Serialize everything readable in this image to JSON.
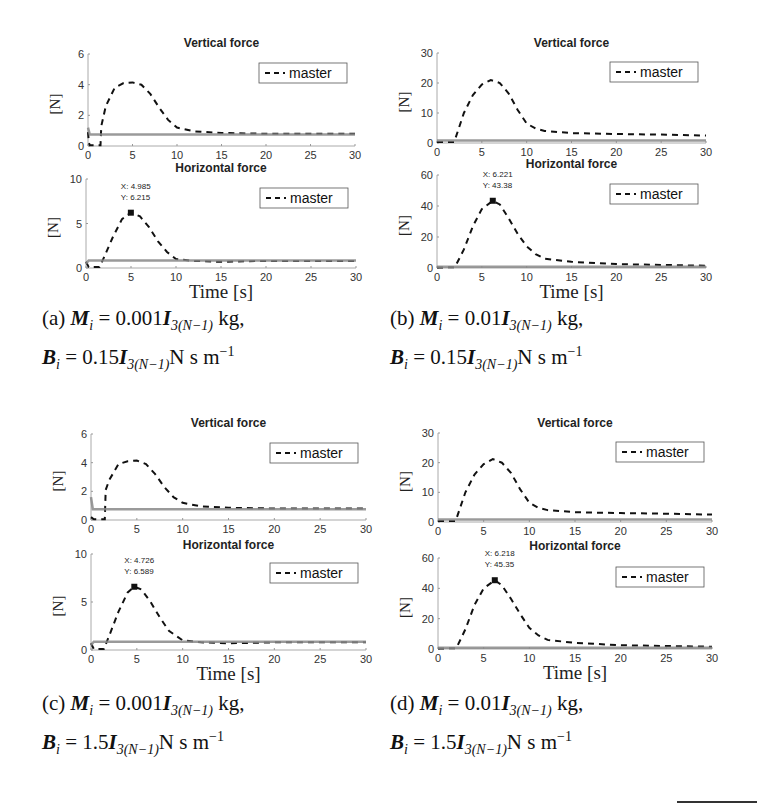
{
  "figure": {
    "panels": [
      {
        "id": "a",
        "caption": {
          "label": "(a)",
          "line1_prefix": "M",
          "line1_sub": "i",
          "line1_eq": " = 0.001",
          "line1_I": "I",
          "line1_I_sub": "3(N−1)",
          "line1_unit": " kg,",
          "line2_prefix": "B",
          "line2_sub": "i",
          "line2_eq": " = 0.15",
          "line2_I": "I",
          "line2_I_sub": "3(N−1)",
          "line2_unit": "N s m",
          "line2_exp": "−1"
        }
      },
      {
        "id": "b",
        "caption": {
          "label": "(b)",
          "line1_prefix": "M",
          "line1_sub": "i",
          "line1_eq": " = 0.01",
          "line1_I": "I",
          "line1_I_sub": "3(N−1)",
          "line1_unit": " kg,",
          "line2_prefix": "B",
          "line2_sub": "i",
          "line2_eq": " = 0.15",
          "line2_I": "I",
          "line2_I_sub": "3(N−1)",
          "line2_unit": "N s m",
          "line2_exp": "−1"
        }
      },
      {
        "id": "c",
        "caption": {
          "label": "(c)",
          "line1_prefix": "M",
          "line1_sub": "i",
          "line1_eq": " = 0.001",
          "line1_I": "I",
          "line1_I_sub": "3(N−1)",
          "line1_unit": " kg,",
          "line2_prefix": "B",
          "line2_sub": "i",
          "line2_eq": " = 1.5",
          "line2_I": "I",
          "line2_I_sub": "3(N−1)",
          "line2_unit": "N s m",
          "line2_exp": "−1"
        }
      },
      {
        "id": "d",
        "caption": {
          "label": "(d)",
          "line1_prefix": "M",
          "line1_sub": "i",
          "line1_eq": " = 0.01",
          "line1_I": "I",
          "line1_I_sub": "3(N−1)",
          "line1_unit": " kg,",
          "line2_prefix": "B",
          "line2_sub": "i",
          "line2_eq": " = 1.5",
          "line2_I": "I",
          "line2_I_sub": "3(N−1)",
          "line2_unit": "N s m",
          "line2_exp": "−1"
        }
      }
    ]
  },
  "chart_data": [
    {
      "panel": "a",
      "subplot": "top",
      "type": "line",
      "title": "Vertical force",
      "xlabel": "",
      "ylabel": "[N]",
      "xlim": [
        0,
        30
      ],
      "ylim": [
        0,
        6
      ],
      "xticks": [
        0,
        5,
        10,
        15,
        20,
        25,
        30
      ],
      "yticks": [
        0,
        2,
        4,
        6
      ],
      "legend": [
        "master"
      ],
      "legend_position": "upper right",
      "series": [
        {
          "name": "master",
          "style": "dashed black",
          "x": [
            0,
            0.1,
            0.2,
            1.4,
            1.5,
            2,
            3,
            4,
            5,
            6,
            7,
            8,
            9,
            10,
            12,
            15,
            20,
            25,
            30
          ],
          "y": [
            0.9,
            0.2,
            0.05,
            0.05,
            1.3,
            2.6,
            3.8,
            4.1,
            4.15,
            4.0,
            3.4,
            2.5,
            1.7,
            1.2,
            0.95,
            0.85,
            0.8,
            0.8,
            0.8
          ]
        },
        {
          "name": "slave (gray solid)",
          "style": "solid gray",
          "x": [
            0,
            0.2,
            30
          ],
          "y": [
            1.2,
            0.75,
            0.75
          ]
        }
      ]
    },
    {
      "panel": "a",
      "subplot": "bottom",
      "type": "line",
      "title": "Horizontal force",
      "xlabel": "Time [s]",
      "ylabel": "[N]",
      "xlim": [
        0,
        30
      ],
      "ylim": [
        0,
        10
      ],
      "xticks": [
        0,
        5,
        10,
        15,
        20,
        25,
        30
      ],
      "yticks": [
        0,
        5,
        10
      ],
      "legend": [
        "master"
      ],
      "legend_position": "upper right",
      "annotation": {
        "x_label": "X: 4.985",
        "y_label": "Y: 6.215",
        "x": 4.985,
        "y": 6.215
      },
      "series": [
        {
          "name": "master",
          "style": "dashed black",
          "x": [
            0,
            0.3,
            1.5,
            2,
            3,
            4,
            4.985,
            6,
            7,
            8,
            9,
            10,
            12,
            15,
            20,
            25,
            30
          ],
          "y": [
            0.7,
            0.1,
            0.1,
            1.2,
            3.5,
            5.5,
            6.215,
            5.8,
            4.6,
            3.0,
            1.8,
            1.0,
            0.8,
            0.7,
            0.8,
            0.8,
            0.8
          ]
        },
        {
          "name": "slave (gray solid)",
          "style": "solid gray",
          "x": [
            0,
            0.3,
            30
          ],
          "y": [
            0.5,
            0.85,
            0.85
          ]
        }
      ]
    },
    {
      "panel": "b",
      "subplot": "top",
      "type": "line",
      "title": "Vertical force",
      "xlabel": "",
      "ylabel": "[N]",
      "xlim": [
        0,
        30
      ],
      "ylim": [
        0,
        30
      ],
      "xticks": [
        0,
        5,
        10,
        15,
        20,
        25,
        30
      ],
      "yticks": [
        0,
        10,
        20,
        30
      ],
      "legend": [
        "master"
      ],
      "legend_position": "upper right",
      "series": [
        {
          "name": "master",
          "style": "dashed black",
          "x": [
            0,
            1.9,
            2,
            3,
            4,
            5,
            6,
            7,
            8,
            9,
            10,
            11,
            12,
            15,
            20,
            25,
            30
          ],
          "y": [
            0.3,
            0.3,
            1.0,
            10,
            16,
            19.5,
            21,
            20,
            16.5,
            11,
            6.5,
            4.8,
            4.0,
            3.3,
            3.0,
            2.8,
            2.5
          ]
        },
        {
          "name": "slave (gray solid)",
          "style": "solid gray",
          "x": [
            0,
            30
          ],
          "y": [
            0.8,
            0.8
          ]
        }
      ]
    },
    {
      "panel": "b",
      "subplot": "bottom",
      "type": "line",
      "title": "Horizontal force",
      "xlabel": "Time [s]",
      "ylabel": "[N]",
      "xlim": [
        0,
        30
      ],
      "ylim": [
        0,
        60
      ],
      "xticks": [
        0,
        5,
        10,
        15,
        20,
        25,
        30
      ],
      "yticks": [
        0,
        20,
        40,
        60
      ],
      "legend": [
        "master"
      ],
      "legend_position": "upper right",
      "annotation": {
        "x_label": "X: 6.221",
        "y_label": "Y: 43.38",
        "x": 6.221,
        "y": 43.38
      },
      "series": [
        {
          "name": "master",
          "style": "dashed black",
          "x": [
            0,
            2,
            3,
            4,
            5,
            6.221,
            7,
            8,
            9,
            10,
            11,
            12,
            15,
            20,
            25,
            30
          ],
          "y": [
            0.3,
            0.5,
            12,
            27,
            38,
            43.38,
            41,
            32,
            22,
            14,
            9,
            6,
            4,
            2.5,
            2,
            1.5
          ]
        },
        {
          "name": "slave (gray solid)",
          "style": "solid gray",
          "x": [
            0,
            30
          ],
          "y": [
            0.8,
            0.8
          ]
        }
      ]
    },
    {
      "panel": "c",
      "subplot": "top",
      "type": "line",
      "title": "Vertical force",
      "xlabel": "",
      "ylabel": "[N]",
      "xlim": [
        0,
        30
      ],
      "ylim": [
        0,
        6
      ],
      "xticks": [
        0,
        5,
        10,
        15,
        20,
        25,
        30
      ],
      "yticks": [
        0,
        2,
        4,
        6
      ],
      "legend": [
        "master"
      ],
      "legend_position": "upper right",
      "series": [
        {
          "name": "master",
          "style": "dashed black",
          "x": [
            0,
            0.3,
            1.5,
            1.6,
            2,
            3,
            4,
            5,
            6,
            7,
            8,
            9,
            10,
            12,
            15,
            20,
            25,
            30
          ],
          "y": [
            0.2,
            0.05,
            0.05,
            2.1,
            2.8,
            3.9,
            4.1,
            4.15,
            3.9,
            3.2,
            2.3,
            1.6,
            1.2,
            0.95,
            0.85,
            0.8,
            0.8,
            0.8
          ]
        },
        {
          "name": "slave (gray solid)",
          "style": "solid gray",
          "x": [
            0,
            0.2,
            30
          ],
          "y": [
            1.6,
            0.75,
            0.75
          ]
        }
      ]
    },
    {
      "panel": "c",
      "subplot": "bottom",
      "type": "line",
      "title": "Horizontal force",
      "xlabel": "Time [s]",
      "ylabel": "[N]",
      "xlim": [
        0,
        30
      ],
      "ylim": [
        0,
        10
      ],
      "xticks": [
        0,
        5,
        10,
        15,
        20,
        25,
        30
      ],
      "yticks": [
        0,
        5,
        10
      ],
      "legend": [
        "master"
      ],
      "legend_position": "upper right",
      "annotation": {
        "x_label": "X: 4.726",
        "y_label": "Y: 6.589",
        "x": 4.726,
        "y": 6.589
      },
      "series": [
        {
          "name": "master",
          "style": "dashed black",
          "x": [
            0,
            0.3,
            1.4,
            2,
            3,
            4,
            4.726,
            5.5,
            6.5,
            7.5,
            8.5,
            10,
            12,
            15,
            20,
            25,
            30
          ],
          "y": [
            0.7,
            0.1,
            0.1,
            1.5,
            4.0,
            6.0,
            6.589,
            6.3,
            5.0,
            3.4,
            2.0,
            1.0,
            0.8,
            0.7,
            0.8,
            0.8,
            0.8
          ]
        },
        {
          "name": "slave (gray solid)",
          "style": "solid gray",
          "x": [
            0,
            0.3,
            30
          ],
          "y": [
            0.5,
            0.85,
            0.85
          ]
        }
      ]
    },
    {
      "panel": "d",
      "subplot": "top",
      "type": "line",
      "title": "Vertical force",
      "xlabel": "",
      "ylabel": "[N]",
      "xlim": [
        0,
        30
      ],
      "ylim": [
        0,
        30
      ],
      "xticks": [
        0,
        5,
        10,
        15,
        20,
        25,
        30
      ],
      "yticks": [
        0,
        10,
        20,
        30
      ],
      "legend": [
        "master"
      ],
      "legend_position": "upper right",
      "series": [
        {
          "name": "master",
          "style": "dashed black",
          "x": [
            0,
            1.9,
            2,
            3,
            4,
            5,
            6,
            7,
            8,
            9,
            10,
            11,
            12,
            15,
            20,
            25,
            30
          ],
          "y": [
            0.3,
            0.3,
            1.0,
            10,
            16,
            19.5,
            21.2,
            20,
            16.5,
            11,
            6.5,
            4.8,
            4.0,
            3.3,
            3.0,
            2.8,
            2.5
          ]
        },
        {
          "name": "slave (gray solid)",
          "style": "solid gray",
          "x": [
            0,
            30
          ],
          "y": [
            0.8,
            0.8
          ]
        }
      ]
    },
    {
      "panel": "d",
      "subplot": "bottom",
      "type": "line",
      "title": "Horizontal force",
      "xlabel": "Time [s]",
      "ylabel": "[N]",
      "xlim": [
        0,
        30
      ],
      "ylim": [
        0,
        60
      ],
      "xticks": [
        0,
        5,
        10,
        15,
        20,
        25,
        30
      ],
      "yticks": [
        0,
        20,
        40,
        60
      ],
      "legend": [
        "master"
      ],
      "legend_position": "upper right",
      "annotation": {
        "x_label": "X: 6.218",
        "y_label": "Y: 45.35",
        "x": 6.218,
        "y": 45.35
      },
      "series": [
        {
          "name": "master",
          "style": "dashed black",
          "x": [
            0,
            2,
            3,
            4,
            5,
            6.218,
            7,
            8,
            9,
            10,
            11,
            12,
            15,
            20,
            25,
            30
          ],
          "y": [
            0.3,
            0.5,
            13,
            29,
            40,
            45.35,
            42,
            33,
            23,
            14,
            9,
            6,
            4,
            2.5,
            2,
            1.5
          ]
        },
        {
          "name": "slave (gray solid)",
          "style": "solid gray",
          "x": [
            0,
            30
          ],
          "y": [
            0.8,
            0.8
          ]
        }
      ]
    }
  ]
}
